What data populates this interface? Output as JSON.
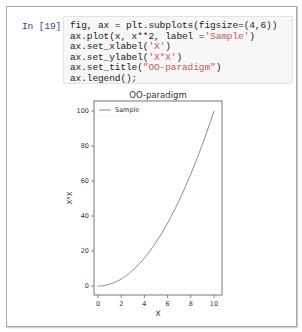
{
  "cell": {
    "prompt": "In [19]:",
    "code_lines": [
      {
        "pre": "fig, ax = plt.subplots(figsize=(4,6))",
        "str": "",
        "post": ""
      },
      {
        "pre": "ax.plot(x, x**2, label =",
        "str": "'Sample'",
        "post": ")"
      },
      {
        "pre": "ax.set_xlabel(",
        "str": "'X'",
        "post": ")"
      },
      {
        "pre": "ax.set_ylabel(",
        "str": "'X*X'",
        "post": ")"
      },
      {
        "pre": "ax.set_title(",
        "str": "\"OO-paradigm\"",
        "post": ")"
      },
      {
        "pre": "ax.legend();",
        "str": "",
        "post": ""
      }
    ]
  },
  "chart_data": {
    "type": "line",
    "title": "OO-paradigm",
    "xlabel": "X",
    "ylabel": "X*X",
    "xlim": [
      -0.5,
      10.5
    ],
    "ylim": [
      -5,
      105
    ],
    "xticks": [
      0,
      2,
      4,
      6,
      8,
      10
    ],
    "yticks": [
      0,
      20,
      40,
      60,
      80,
      100
    ],
    "grid": false,
    "legend_position": "upper left",
    "series": [
      {
        "name": "Sample",
        "color": "#7f8c9d",
        "x": [
          0,
          0.5,
          1,
          1.5,
          2,
          2.5,
          3,
          3.5,
          4,
          4.5,
          5,
          5.5,
          6,
          6.5,
          7,
          7.5,
          8,
          8.5,
          9,
          9.5,
          10
        ],
        "y": [
          0,
          0.25,
          1,
          2.25,
          4,
          6.25,
          9,
          12.25,
          16,
          20.25,
          25,
          30.25,
          36,
          42.25,
          49,
          56.25,
          64,
          72.25,
          81,
          90.25,
          100
        ]
      }
    ]
  }
}
